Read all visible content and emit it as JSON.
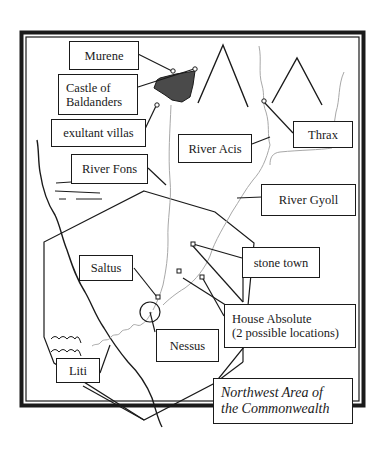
{
  "map": {
    "title_line1": "Northwest Area of",
    "title_line2": "the Commonwealth",
    "colors": {
      "ink": "#1a1a1a",
      "river": "#a8a8a8",
      "lake": "#4a4a4a",
      "background": "#ffffff"
    },
    "labels": {
      "murene": "Murene",
      "castle_line1": "Castle of",
      "castle_line2": "Baldanders",
      "exultant_villas": "exultant villas",
      "river_fons": "River Fons",
      "river_acis": "River Acis",
      "thrax": "Thrax",
      "river_gyoll": "River Gyoll",
      "stone_town": "stone town",
      "saltus": "Saltus",
      "house_absolute_line1": "House Absolute",
      "house_absolute_line2": "(2 possible locations)",
      "nessus": "Nessus",
      "liti": "Liti"
    },
    "features": [
      {
        "name": "mountain",
        "count": 2
      },
      {
        "name": "lake",
        "count": 1
      },
      {
        "name": "wall-hexagon",
        "count": 1
      },
      {
        "name": "coastline",
        "count": 1
      },
      {
        "name": "waves",
        "count": 2
      },
      {
        "name": "marsh-lines",
        "count": 3
      }
    ]
  }
}
